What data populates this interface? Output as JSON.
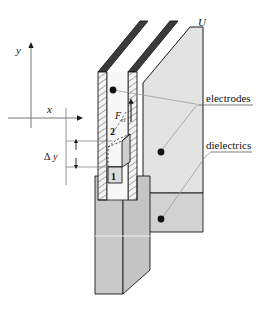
{
  "figure": {
    "labels": {
      "voltage": "U",
      "axis_y": "y",
      "axis_x": "x",
      "force": "F",
      "force_subscript": "el",
      "state_1": "1",
      "state_2": "2",
      "delta_symbol": "Δ",
      "delta_var": "y",
      "electrodes": "electrodes",
      "dielectrics": "dielectrics"
    },
    "colors": {
      "electrode_dark": "#3b3b3b",
      "plate_face": "#ececec",
      "right_panel": "#e0e0e0",
      "liquid_column": "#c9c9c9",
      "hatch_line": "#555555",
      "outline": "#1a1a1a",
      "leader": "#8a8a8a",
      "text": "#111111",
      "background": "#ffffff"
    }
  }
}
